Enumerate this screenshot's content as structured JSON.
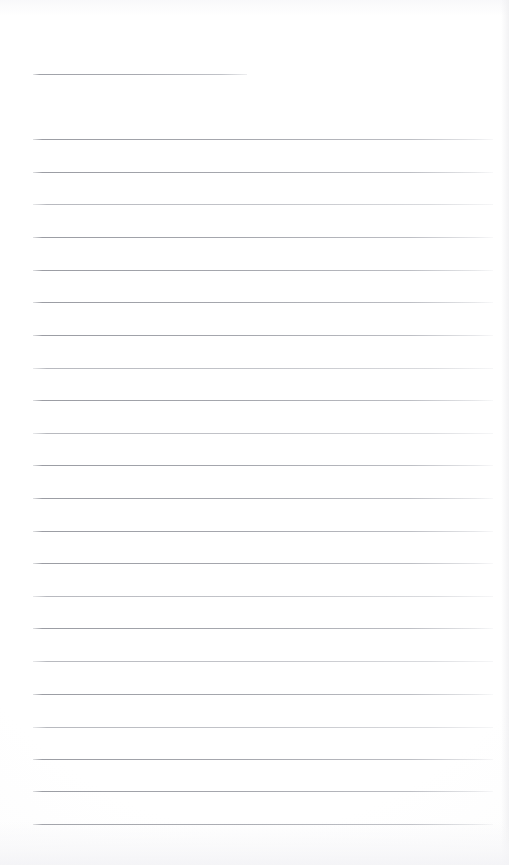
{
  "document": {
    "kind": "ruled-notepad-page",
    "title_text": "",
    "body_text": "",
    "page_width": 509,
    "page_height": 865,
    "background_color": "#ffffff",
    "rule_color": "#9a9ca3",
    "paper_shade_color": "#f4f4f6"
  },
  "title_rule": {
    "name": "title-underline",
    "x": 33,
    "y": 74,
    "width": 214,
    "thickness": 1
  },
  "ruling": {
    "left_margin": 33,
    "right_edge": 493,
    "line_width": 460,
    "first_line_y": 139,
    "line_spacing": 32.6,
    "line_count": 22,
    "thickness": 1,
    "lines": [
      {
        "index": 1,
        "y": 139,
        "faint": false
      },
      {
        "index": 2,
        "y": 172,
        "faint": false
      },
      {
        "index": 3,
        "y": 204,
        "faint": true
      },
      {
        "index": 4,
        "y": 237,
        "faint": false
      },
      {
        "index": 5,
        "y": 270,
        "faint": false
      },
      {
        "index": 6,
        "y": 302,
        "faint": false
      },
      {
        "index": 7,
        "y": 335,
        "faint": false
      },
      {
        "index": 8,
        "y": 368,
        "faint": true
      },
      {
        "index": 9,
        "y": 400,
        "faint": false
      },
      {
        "index": 10,
        "y": 433,
        "faint": true
      },
      {
        "index": 11,
        "y": 465,
        "faint": false
      },
      {
        "index": 12,
        "y": 498,
        "faint": false
      },
      {
        "index": 13,
        "y": 531,
        "faint": false
      },
      {
        "index": 14,
        "y": 563,
        "faint": false
      },
      {
        "index": 15,
        "y": 596,
        "faint": true
      },
      {
        "index": 16,
        "y": 628,
        "faint": false
      },
      {
        "index": 17,
        "y": 661,
        "faint": true
      },
      {
        "index": 18,
        "y": 694,
        "faint": false
      },
      {
        "index": 19,
        "y": 727,
        "faint": true
      },
      {
        "index": 20,
        "y": 759,
        "faint": false
      },
      {
        "index": 21,
        "y": 791,
        "faint": false
      },
      {
        "index": 22,
        "y": 824,
        "faint": false
      }
    ]
  }
}
